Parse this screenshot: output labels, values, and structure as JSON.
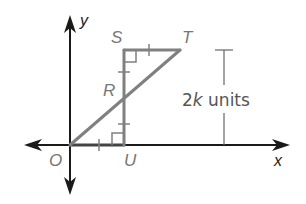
{
  "diagram": {
    "axes": {
      "x_label": "x",
      "y_label": "y",
      "origin_label": "O"
    },
    "points": {
      "O": {
        "label": "O"
      },
      "U": {
        "label": "U"
      },
      "S": {
        "label": "S"
      },
      "T": {
        "label": "T"
      },
      "R": {
        "label": "R"
      }
    },
    "dimension": {
      "prefix": "2",
      "variable": "k",
      "suffix": " units"
    },
    "colors": {
      "axis": "#1a1a1a",
      "figure": "#808080",
      "label": "#777777"
    }
  }
}
